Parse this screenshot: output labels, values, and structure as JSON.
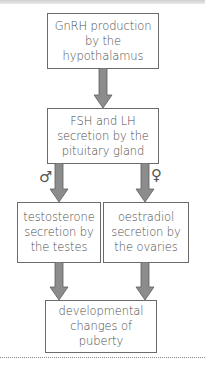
{
  "diagram": {
    "type": "flowchart",
    "nodes": [
      {
        "id": "gnrh",
        "label": "GnRH production\nby the hypothalamus"
      },
      {
        "id": "fsh_lh",
        "label": "FSH and LH\nsecretion by the\npituitary gland"
      },
      {
        "id": "testosterone",
        "label": "testosterone\nsecretion by\nthe testes"
      },
      {
        "id": "oestradiol",
        "label": "oestradiol\nsecretion by\nthe ovaries"
      },
      {
        "id": "puberty",
        "label": "developmental\nchanges of\npuberty"
      }
    ],
    "edges": [
      {
        "from": "gnrh",
        "to": "fsh_lh",
        "label": ""
      },
      {
        "from": "fsh_lh",
        "to": "testosterone",
        "label": "male-symbol"
      },
      {
        "from": "fsh_lh",
        "to": "oestradiol",
        "label": "female-symbol"
      },
      {
        "from": "testosterone",
        "to": "puberty",
        "label": ""
      },
      {
        "from": "oestradiol",
        "to": "puberty",
        "label": ""
      }
    ],
    "symbols": {
      "male": "♂",
      "female": "♀"
    },
    "colors": {
      "arrow_fill": "#8c8c8c",
      "arrow_stroke": "#5e5e5e",
      "box_border": "#6b6b6b",
      "text": "#4d4d4d"
    }
  }
}
